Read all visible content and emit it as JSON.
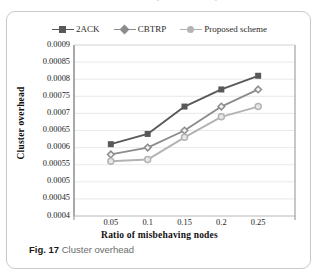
{
  "figure": {
    "caption_prefix": "Fig. 17",
    "caption_text": "Cluster overhead"
  },
  "colors": {
    "series_2ack": "#595959",
    "series_cbtrp": "#8c8c8c",
    "series_proposed": "#b3b3b3",
    "axis": "#808080",
    "gridline": "#e3e3e3",
    "plot_background": "#ffffff",
    "card_border": "#c9c9c9"
  },
  "chart_data": {
    "type": "line",
    "title": "",
    "xlabel": "Ratio  of misbehaving nodes",
    "ylabel": "Cluster overhead",
    "x": [
      0.05,
      0.1,
      0.15,
      0.2,
      0.25
    ],
    "categories": [
      "0.05",
      "0.1",
      "0.15",
      "0.2",
      "0.25"
    ],
    "xtick_labels": [
      "0.05",
      "0.1",
      "0.15",
      "0.2",
      "0.25"
    ],
    "ytick_labels": [
      "0.0009",
      "0.00085",
      "0.0008",
      "0.00075",
      "0.0007",
      "0.00065",
      "0.0006",
      "0.00055",
      "0.0005",
      "0.00045",
      "0.0004"
    ],
    "ytick_values": [
      0.0009,
      0.00085,
      0.0008,
      0.00075,
      0.0007,
      0.00065,
      0.0006,
      0.00055,
      0.0005,
      0.00045,
      0.0004
    ],
    "ylim": [
      0.0004,
      0.0009
    ],
    "xlim": [
      0,
      6
    ],
    "grid": "horizontal",
    "legend_position": "top-center",
    "series": [
      {
        "name": "2ACK",
        "marker": "square",
        "color": "#595959",
        "values": [
          0.00061,
          0.00064,
          0.00072,
          0.00077,
          0.00081
        ]
      },
      {
        "name": "CBTRP",
        "marker": "diamond",
        "color": "#8c8c8c",
        "values": [
          0.00058,
          0.0006,
          0.00065,
          0.00072,
          0.00077
        ]
      },
      {
        "name": "Proposed scheme",
        "marker": "circle",
        "color": "#b3b3b3",
        "values": [
          0.00056,
          0.000565,
          0.00063,
          0.00069,
          0.00072
        ]
      }
    ]
  },
  "artifact": {
    "top_glyphs": "ʔ                    ʔ"
  }
}
